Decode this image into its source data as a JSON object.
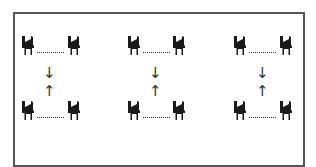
{
  "diagram": {
    "groups": [
      {
        "id": "group-1",
        "top_pair": [
          "chair",
          "chair"
        ],
        "bottom_pair": [
          "chair",
          "chair"
        ],
        "arrows": {
          "upper": "↓",
          "lower": "↑"
        }
      },
      {
        "id": "group-2",
        "top_pair": [
          "chair",
          "chair"
        ],
        "bottom_pair": [
          "chair",
          "chair"
        ],
        "arrows": {
          "upper": "↓",
          "lower": "↑"
        }
      },
      {
        "id": "group-3",
        "top_pair": [
          "chair",
          "chair"
        ],
        "bottom_pair": [
          "chair",
          "chair"
        ],
        "arrows": {
          "upper": "↓",
          "lower": "↑"
        }
      }
    ],
    "icons": {
      "chair": "chair-icon"
    },
    "colors": {
      "border": "#555555",
      "icon": "#1a1a1a",
      "lines": "#333333",
      "background": "#ffffff"
    }
  }
}
